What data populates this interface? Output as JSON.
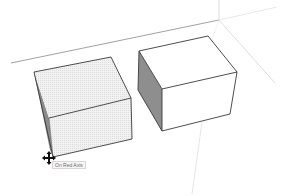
{
  "app": "SketchUp",
  "viewport": {
    "background": "#ffffff",
    "axes": {
      "color_light": "#dcdcdc",
      "color_horizon": "#8a8a8a"
    },
    "objects": [
      {
        "name": "left-box",
        "state": "selected",
        "face_fill": "#ececec",
        "side_fill": "#8c8c8c",
        "edge_color": "#3a3a3a"
      },
      {
        "name": "right-box",
        "state": "normal",
        "face_fill": "#ffffff",
        "side_fill": "#8e8e8e",
        "edge_color": "#3a3a3a"
      }
    ]
  },
  "cursor": {
    "icon": "move-icon"
  },
  "tooltip": {
    "text": "On Red Axis"
  }
}
